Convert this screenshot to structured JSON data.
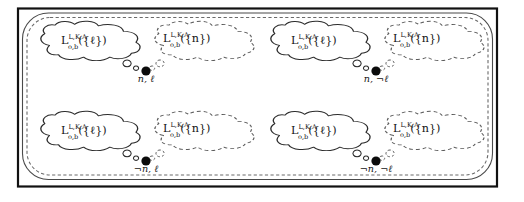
{
  "figure": {
    "kind": "thought-bubble-diagram",
    "background_color": "#ffffff",
    "frame": {
      "outer_border_color": "#111111",
      "inner_solid_color": "#4a4a4a",
      "inner_dashed_color": "#6a6a6a"
    },
    "bubble_solid_color": "#2b2b2b",
    "bubble_dashed_color": "#5a5a5a",
    "node_dot_color": "#0b0b0b",
    "formula_base": "L",
    "formula_superscript": "L,K,A",
    "formula_subscript": "o,b",
    "formula_arg_ell": "({ℓ})",
    "formula_arg_n": "({n})"
  },
  "groups": [
    {
      "id": "top-left",
      "dot_label": "n, ℓ",
      "left_bubble": {
        "style": "solid",
        "base": "L",
        "sup": "L,K,A",
        "sub": "o,b",
        "arg": "({ℓ})"
      },
      "right_bubble": {
        "style": "dashed",
        "base": "L",
        "sup": "L,K,A",
        "sub": "o,b",
        "arg": "({n})"
      }
    },
    {
      "id": "top-right",
      "dot_label": "n, ¬ℓ",
      "left_bubble": {
        "style": "solid",
        "base": "L",
        "sup": "L,K,A",
        "sub": "o,b",
        "arg": "({ℓ})"
      },
      "right_bubble": {
        "style": "dashed",
        "base": "L",
        "sup": "L,K,A",
        "sub": "o,b",
        "arg": "({n})"
      }
    },
    {
      "id": "bottom-left",
      "dot_label": "¬n, ℓ",
      "left_bubble": {
        "style": "solid",
        "base": "L",
        "sup": "L,K,A",
        "sub": "o,b",
        "arg": "({ℓ})"
      },
      "right_bubble": {
        "style": "dashed",
        "base": "L",
        "sup": "L,K,A",
        "sub": "o,b",
        "arg": "({n})"
      }
    },
    {
      "id": "bottom-right",
      "dot_label": "¬n, ¬ℓ",
      "left_bubble": {
        "style": "solid",
        "base": "L",
        "sup": "L,K,A",
        "sub": "o,b",
        "arg": "({ℓ})"
      },
      "right_bubble": {
        "style": "dashed",
        "base": "L",
        "sup": "L,K,A",
        "sub": "o,b",
        "arg": "({n})"
      }
    }
  ]
}
